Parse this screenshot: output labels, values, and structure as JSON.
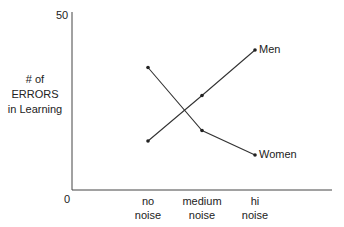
{
  "chart_data": {
    "type": "line",
    "title": "",
    "xlabel": "",
    "ylabel": "# of ERRORS in Learning",
    "ylabel_lines": [
      "# of",
      "ERRORS",
      "in Learning"
    ],
    "ylim": [
      0,
      50
    ],
    "y_ticks": [
      "0",
      "50"
    ],
    "categories": [
      "no noise",
      "medium noise",
      "hi noise"
    ],
    "category_lines": [
      [
        "no",
        "noise"
      ],
      [
        "medium",
        "noise"
      ],
      [
        "hi",
        "noise"
      ]
    ],
    "series": [
      {
        "name": "Men",
        "values": [
          14,
          27,
          40
        ]
      },
      {
        "name": "Women",
        "values": [
          35,
          17,
          10
        ]
      }
    ],
    "grid": false,
    "legend": "inline labels at series end"
  },
  "colors": {
    "line": "#333333",
    "axis": "#444444",
    "text": "#222222"
  }
}
